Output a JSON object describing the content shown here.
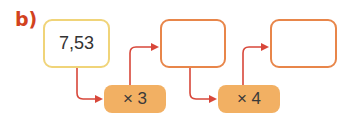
{
  "exercise_label": "b)",
  "boxes": [
    {
      "value": "7,53"
    },
    {
      "value": ""
    },
    {
      "value": ""
    }
  ],
  "operations": [
    {
      "label": "× 3"
    },
    {
      "label": "× 4"
    }
  ],
  "colors": {
    "label": "#d2421e",
    "start_box_border": "#f0d479",
    "empty_box_border": "#e8864a",
    "operation_fill": "#f2b063",
    "arrow": "#d8473a"
  }
}
